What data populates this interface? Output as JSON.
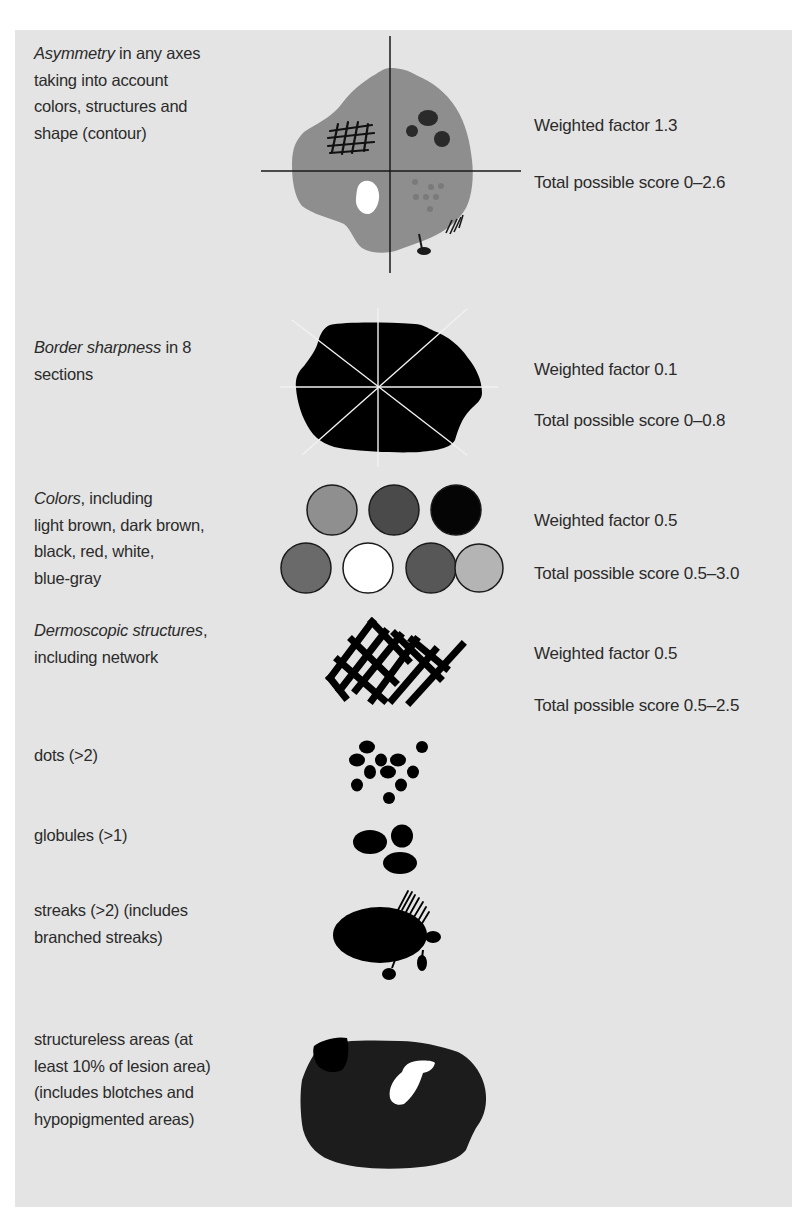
{
  "figure": {
    "background_color": "#e4e4e4",
    "text_color": "#2b2b2b",
    "sections": [
      {
        "id": "asymmetry",
        "label_italic": "Asymmetry",
        "label_rest_line1": " in any axes",
        "label_lines": [
          "taking into account",
          "colors, structures and",
          "shape (contour)"
        ],
        "weighted_factor": "Weighted factor 1.3",
        "score_range": "Total possible score 0–2.6",
        "illustration": "lesion-with-axes-icon",
        "colors": {
          "lesion": "#8e8e8e",
          "axes": "#1a1a1a",
          "dots_dark": "#2a2a2a",
          "dots_light": "#7a7a7a",
          "hypopigment": "#ffffff"
        }
      },
      {
        "id": "border",
        "label_italic": "Border sharpness",
        "label_rest_line1": " in 8",
        "label_lines": [
          "sections"
        ],
        "weighted_factor": "Weighted factor 0.1",
        "score_range": "Total possible score 0–0.8",
        "illustration": "black-lesion-8-sections-icon",
        "colors": {
          "lesion": "#000000",
          "section_lines": "#f2f2f2"
        }
      },
      {
        "id": "colors",
        "label_italic": "Colors",
        "label_rest_line1": ", including",
        "label_lines": [
          "light brown, dark brown,",
          "black, red, white,",
          "blue-gray"
        ],
        "weighted_factor": "Weighted factor 0.5",
        "score_range": "Total possible score 0.5–3.0",
        "illustration": "color-swatches-icon",
        "swatches": [
          {
            "name": "light brown",
            "fill": "#8f8f8f"
          },
          {
            "name": "dark brown",
            "fill": "#4a4a4a"
          },
          {
            "name": "black",
            "fill": "#050505"
          },
          {
            "name": "red",
            "fill": "#6a6a6a"
          },
          {
            "name": "white",
            "fill": "#ffffff"
          },
          {
            "name": "dark",
            "fill": "#575757"
          },
          {
            "name": "blue-gray",
            "fill": "#b4b4b4"
          }
        ]
      },
      {
        "id": "structures",
        "label_italic": "Dermoscopic structures",
        "label_rest_line1": ",",
        "label_lines": [
          "including network"
        ],
        "weighted_factor": "Weighted factor 0.5",
        "score_range": "Total possible score 0.5–2.5",
        "illustration": "pigment-network-icon"
      },
      {
        "id": "dots",
        "label_lines": [
          "dots (>2)"
        ],
        "illustration": "dots-icon"
      },
      {
        "id": "globules",
        "label_lines": [
          "globules (>1)"
        ],
        "illustration": "globules-icon"
      },
      {
        "id": "streaks",
        "label_lines": [
          "streaks (>2) (includes",
          "branched streaks)"
        ],
        "illustration": "streaks-icon"
      },
      {
        "id": "structureless",
        "label_lines": [
          "structureless areas (at",
          "least 10% of lesion area)",
          "(includes blotches and",
          "hypopigmented areas)"
        ],
        "illustration": "structureless-lesion-icon",
        "colors": {
          "lesion": "#1c1c1c",
          "blotch": "#000000",
          "hypopigment": "#ffffff"
        }
      }
    ]
  }
}
